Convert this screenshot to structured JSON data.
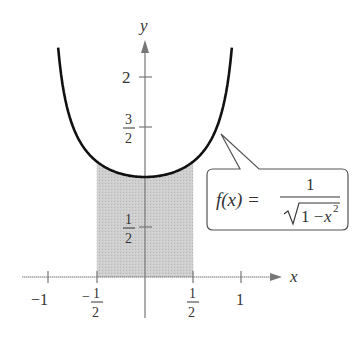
{
  "chart_data": {
    "type": "area",
    "title": "",
    "function": "f(x) = 1 / sqrt(1 - x^2)",
    "xlabel": "x",
    "ylabel": "y",
    "x_ticks": [
      {
        "value": -1,
        "label": "−1"
      },
      {
        "value": -0.5,
        "label": "−1/2"
      },
      {
        "value": 0.5,
        "label": "1/2"
      },
      {
        "value": 1,
        "label": "1"
      }
    ],
    "y_ticks": [
      {
        "value": 0.5,
        "label": "1/2"
      },
      {
        "value": 1.5,
        "label": "3/2"
      },
      {
        "value": 2,
        "label": "2"
      }
    ],
    "curve_domain": [
      -0.9,
      0.9
    ],
    "shaded_region": {
      "x_from": -0.5,
      "x_to": 0.5,
      "description": "area under f(x) between x = -1/2 and x = 1/2"
    },
    "xlim": [
      -1.25,
      1.5
    ],
    "ylim": [
      -0.4,
      2.6
    ],
    "grid": false,
    "annotation": {
      "text": "f(x) = 1/√(1 − x²)",
      "points_to_x": 0.75
    }
  },
  "labels": {
    "x_axis": "x",
    "y_axis": "y",
    "x_neg1": "−1",
    "x_neg_half_num": "1",
    "x_neg_half_den": "2",
    "x_neg_sign": "−",
    "x_half_num": "1",
    "x_half_den": "2",
    "x_1": "1",
    "y_half_num": "1",
    "y_half_den": "2",
    "y_3half_num": "3",
    "y_3half_den": "2",
    "y_2": "2"
  },
  "callout": {
    "lhs": "f(x) =",
    "numerator": "1",
    "radicand_1": "1 −",
    "radicand_x": "x",
    "exponent": "2"
  },
  "colors": {
    "axis": "#666666",
    "curve": "#111111",
    "shade": "#c8c8c8",
    "text": "#333333"
  }
}
